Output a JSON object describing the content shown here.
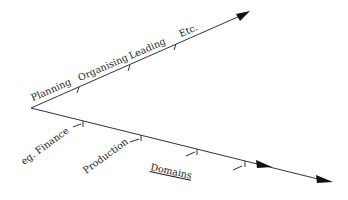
{
  "diagram": {
    "upper_axis": {
      "labels": [
        "Planning",
        "Organising",
        "Leading",
        "Etc."
      ]
    },
    "lower_axis": {
      "labels": [
        "eg. Finance",
        "Production"
      ],
      "title": "Domains"
    }
  }
}
